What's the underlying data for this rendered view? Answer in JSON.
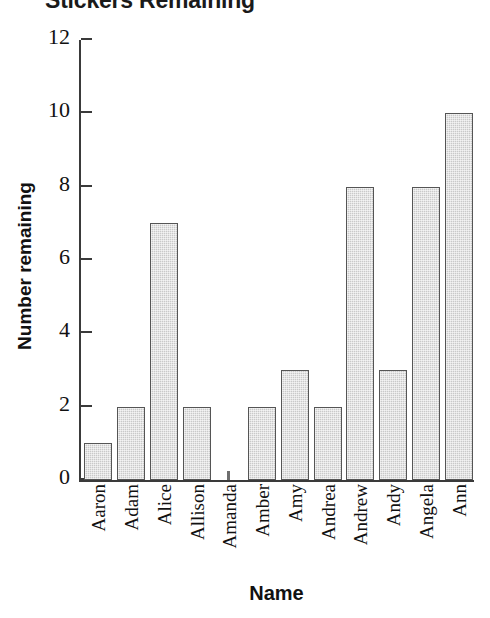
{
  "chart_data": {
    "type": "bar",
    "title": "Stickers Remaining",
    "xlabel": "Name",
    "ylabel": "Number remaining",
    "categories": [
      "Aaron",
      "Adam",
      "Alice",
      "Allison",
      "Amanda",
      "Amber",
      "Amy",
      "Andrea",
      "Andrew",
      "Andy",
      "Angela",
      "Ann"
    ],
    "values": [
      1,
      2,
      7,
      2,
      0,
      2,
      3,
      2,
      8,
      3,
      8,
      10
    ],
    "ylim": [
      0,
      12
    ],
    "yticks": [
      0,
      2,
      4,
      6,
      8,
      10,
      12
    ],
    "ytick_labels": [
      "0",
      "2",
      "4",
      "6",
      "8",
      "10",
      "12"
    ],
    "grid": false,
    "legend": "none",
    "bar_fill_color": "#c9c9c9",
    "bar_edge_color": "#555555",
    "axis_color": "#3a3a3a",
    "text_color": "#111111",
    "background_color": "#ffffff"
  }
}
